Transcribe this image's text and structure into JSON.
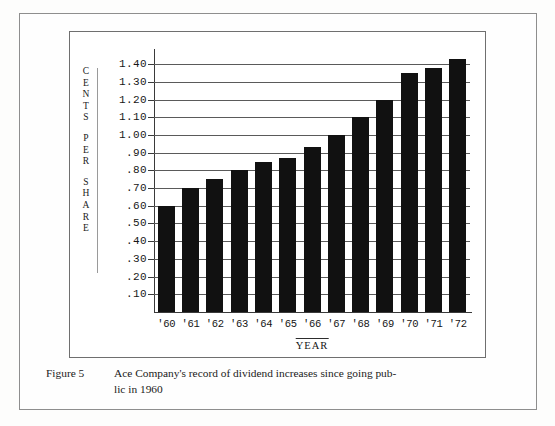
{
  "figure": {
    "label": "Figure 5",
    "caption_line1": "Ace Company's record of dividend increases since going pub-",
    "caption_line2": "lic in 1960"
  },
  "chart_data": {
    "type": "bar",
    "title": "",
    "xlabel": "YEAR",
    "ylabel": "CENTS PER SHARE",
    "categories": [
      "'60",
      "'61",
      "'62",
      "'63",
      "'64",
      "'65",
      "'66",
      "'67",
      "'68",
      "'69",
      "'70",
      "'71",
      "'72"
    ],
    "values": [
      0.6,
      0.7,
      0.75,
      0.8,
      0.85,
      0.87,
      0.93,
      1.0,
      1.1,
      1.2,
      1.35,
      1.38,
      1.43
    ],
    "ylim": [
      0,
      1.48
    ],
    "ytick_values": [
      0.1,
      0.2,
      0.3,
      0.4,
      0.5,
      0.6,
      0.7,
      0.8,
      0.9,
      1.0,
      1.1,
      1.2,
      1.3,
      1.4
    ],
    "ytick_labels": [
      ".10",
      ".20",
      ".30",
      ".40",
      ".50",
      ".60",
      ".70",
      ".80",
      ".90",
      "1.00",
      "1.10",
      "1.20",
      "1.30",
      "1.40"
    ],
    "grid": true,
    "legend": null,
    "bar_color": "#111111",
    "gridline_color": "#5a5a5a"
  },
  "y_axis_title_chars": {
    "word1": [
      "C",
      "E",
      "N",
      "T",
      "S"
    ],
    "word2": [
      "P",
      "E",
      "R"
    ],
    "word3": [
      "S",
      "H",
      "A",
      "R",
      "E"
    ]
  }
}
